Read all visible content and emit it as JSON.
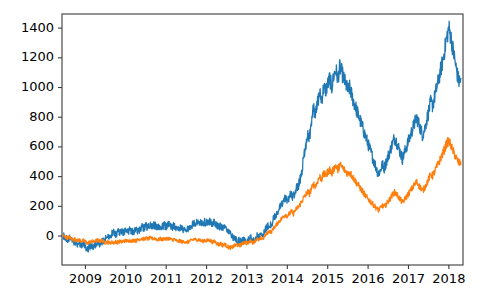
{
  "chart_data": {
    "type": "line",
    "title": "",
    "subtitle": "",
    "xlabel": "",
    "ylabel": "",
    "grid": false,
    "legend": "none",
    "xlim": [
      2008.42,
      2018.35
    ],
    "ylim": [
      -195,
      1495
    ],
    "x_tick_labels": [
      "2009",
      "2010",
      "2011",
      "2012",
      "2013",
      "2014",
      "2015",
      "2016",
      "2017",
      "2018"
    ],
    "x_tick_values": [
      2009,
      2010,
      2011,
      2012,
      2013,
      2014,
      2015,
      2016,
      2017,
      2018
    ],
    "y_tick_labels": [
      "0",
      "200",
      "400",
      "600",
      "800",
      "1000",
      "1200",
      "1400"
    ],
    "y_tick_values": [
      0,
      200,
      400,
      600,
      800,
      1000,
      1200,
      1400
    ],
    "colors": {
      "series_1": "#1f77b4",
      "series_2": "#ff7f0e",
      "axis": "#3b3b3b",
      "background": "#ffffff"
    },
    "series": [
      {
        "name": "series-1",
        "color": "#1f77b4",
        "x": [
          2008.45,
          2008.5,
          2008.55,
          2008.6,
          2008.65,
          2008.7,
          2008.75,
          2008.8,
          2008.85,
          2008.9,
          2008.95,
          2009.0,
          2009.05,
          2009.1,
          2009.15,
          2009.2,
          2009.25,
          2009.3,
          2009.35,
          2009.4,
          2009.45,
          2009.5,
          2009.55,
          2009.6,
          2009.65,
          2009.7,
          2009.75,
          2009.8,
          2009.85,
          2009.9,
          2009.95,
          2010.0,
          2010.05,
          2010.1,
          2010.15,
          2010.2,
          2010.25,
          2010.3,
          2010.35,
          2010.4,
          2010.45,
          2010.5,
          2010.55,
          2010.6,
          2010.65,
          2010.7,
          2010.75,
          2010.8,
          2010.85,
          2010.9,
          2010.95,
          2011.0,
          2011.05,
          2011.1,
          2011.15,
          2011.2,
          2011.25,
          2011.3,
          2011.35,
          2011.4,
          2011.45,
          2011.5,
          2011.55,
          2011.6,
          2011.65,
          2011.7,
          2011.75,
          2011.8,
          2011.85,
          2011.9,
          2011.95,
          2012.0,
          2012.05,
          2012.1,
          2012.15,
          2012.2,
          2012.25,
          2012.3,
          2012.35,
          2012.4,
          2012.45,
          2012.5,
          2012.55,
          2012.6,
          2012.65,
          2012.7,
          2012.75,
          2012.8,
          2012.85,
          2012.9,
          2012.95,
          2013.0,
          2013.05,
          2013.1,
          2013.15,
          2013.2,
          2013.25,
          2013.3,
          2013.35,
          2013.4,
          2013.45,
          2013.5,
          2013.55,
          2013.6,
          2013.65,
          2013.7,
          2013.75,
          2013.8,
          2013.85,
          2013.9,
          2013.95,
          2014.0,
          2014.05,
          2014.1,
          2014.15,
          2014.2,
          2014.25,
          2014.3,
          2014.35,
          2014.4,
          2014.45,
          2014.5,
          2014.55,
          2014.6,
          2014.65,
          2014.7,
          2014.75,
          2014.8,
          2014.85,
          2014.9,
          2014.95,
          2015.0,
          2015.05,
          2015.1,
          2015.15,
          2015.2,
          2015.25,
          2015.3,
          2015.35,
          2015.4,
          2015.45,
          2015.5,
          2015.55,
          2015.6,
          2015.65,
          2015.7,
          2015.75,
          2015.8,
          2015.85,
          2015.9,
          2015.95,
          2016.0,
          2016.05,
          2016.1,
          2016.15,
          2016.2,
          2016.25,
          2016.3,
          2016.35,
          2016.4,
          2016.45,
          2016.5,
          2016.55,
          2016.6,
          2016.65,
          2016.7,
          2016.75,
          2016.8,
          2016.85,
          2016.9,
          2016.95,
          2017.0,
          2017.05,
          2017.1,
          2017.15,
          2017.2,
          2017.25,
          2017.3,
          2017.35,
          2017.4,
          2017.45,
          2017.5,
          2017.55,
          2017.6,
          2017.65,
          2017.7,
          2017.75,
          2017.8,
          2017.85,
          2017.9,
          2017.95,
          2018.0,
          2018.05,
          2018.1,
          2018.15,
          2018.2,
          2018.25,
          2018.3
        ],
        "y": [
          5,
          -8,
          -20,
          -12,
          -28,
          -45,
          -38,
          -55,
          -48,
          -62,
          -58,
          -70,
          -85,
          -78,
          -65,
          -72,
          -60,
          -52,
          -58,
          -45,
          -30,
          -18,
          5,
          -10,
          15,
          25,
          10,
          30,
          20,
          35,
          25,
          40,
          30,
          45,
          35,
          28,
          42,
          30,
          48,
          60,
          52,
          68,
          58,
          72,
          60,
          75,
          65,
          58,
          70,
          60,
          72,
          65,
          78,
          70,
          60,
          72,
          55,
          48,
          60,
          40,
          52,
          35,
          48,
          58,
          75,
          95,
          88,
          100,
          92,
          85,
          95,
          88,
          100,
          92,
          80,
          95,
          75,
          60,
          72,
          50,
          62,
          45,
          30,
          15,
          -5,
          -20,
          -35,
          -28,
          -42,
          -30,
          -20,
          -35,
          -25,
          -10,
          -30,
          -15,
          5,
          -10,
          20,
          10,
          45,
          60,
          80,
          70,
          110,
          130,
          160,
          185,
          205,
          230,
          255,
          240,
          265,
          285,
          260,
          300,
          330,
          360,
          420,
          520,
          600,
          700,
          660,
          780,
          860,
          820,
          900,
          960,
          920,
          1000,
          980,
          1020,
          1060,
          1000,
          1080,
          1120,
          1060,
          1140,
          1100,
          1060,
          1020,
          980,
          1000,
          940,
          900,
          860,
          820,
          780,
          740,
          700,
          660,
          620,
          580,
          540,
          500,
          460,
          420,
          440,
          480,
          460,
          500,
          540,
          580,
          620,
          660,
          640,
          600,
          560,
          520,
          560,
          600,
          640,
          680,
          720,
          760,
          800,
          760,
          720,
          680,
          720,
          780,
          840,
          900,
          880,
          940,
          1000,
          1060,
          1120,
          1180,
          1260,
          1340,
          1400,
          1340,
          1260,
          1180,
          1100,
          1040,
          1060
        ],
        "y_min": -85,
        "y_max": 1400,
        "y_last": 1060
      },
      {
        "name": "series-2",
        "color": "#ff7f0e",
        "x": [
          2008.45,
          2008.5,
          2008.55,
          2008.6,
          2008.65,
          2008.7,
          2008.75,
          2008.8,
          2008.85,
          2008.9,
          2008.95,
          2009.0,
          2009.05,
          2009.1,
          2009.15,
          2009.2,
          2009.25,
          2009.3,
          2009.35,
          2009.4,
          2009.45,
          2009.5,
          2009.55,
          2009.6,
          2009.65,
          2009.7,
          2009.75,
          2009.8,
          2009.85,
          2009.9,
          2009.95,
          2010.0,
          2010.05,
          2010.1,
          2010.15,
          2010.2,
          2010.25,
          2010.3,
          2010.35,
          2010.4,
          2010.45,
          2010.5,
          2010.55,
          2010.6,
          2010.65,
          2010.7,
          2010.75,
          2010.8,
          2010.85,
          2010.9,
          2010.95,
          2011.0,
          2011.05,
          2011.1,
          2011.15,
          2011.2,
          2011.25,
          2011.3,
          2011.35,
          2011.4,
          2011.45,
          2011.5,
          2011.55,
          2011.6,
          2011.65,
          2011.7,
          2011.75,
          2011.8,
          2011.85,
          2011.9,
          2011.95,
          2012.0,
          2012.05,
          2012.1,
          2012.15,
          2012.2,
          2012.25,
          2012.3,
          2012.35,
          2012.4,
          2012.45,
          2012.5,
          2012.55,
          2012.6,
          2012.65,
          2012.7,
          2012.75,
          2012.8,
          2012.85,
          2012.9,
          2012.95,
          2013.0,
          2013.05,
          2013.1,
          2013.15,
          2013.2,
          2013.25,
          2013.3,
          2013.35,
          2013.4,
          2013.45,
          2013.5,
          2013.55,
          2013.6,
          2013.65,
          2013.7,
          2013.75,
          2013.8,
          2013.85,
          2013.9,
          2013.95,
          2014.0,
          2014.05,
          2014.1,
          2014.15,
          2014.2,
          2014.25,
          2014.3,
          2014.35,
          2014.4,
          2014.45,
          2014.5,
          2014.55,
          2014.6,
          2014.65,
          2014.7,
          2014.75,
          2014.8,
          2014.85,
          2014.9,
          2014.95,
          2015.0,
          2015.05,
          2015.1,
          2015.15,
          2015.2,
          2015.25,
          2015.3,
          2015.35,
          2015.4,
          2015.45,
          2015.5,
          2015.55,
          2015.6,
          2015.65,
          2015.7,
          2015.75,
          2015.8,
          2015.85,
          2015.9,
          2015.95,
          2016.0,
          2016.05,
          2016.1,
          2016.15,
          2016.2,
          2016.25,
          2016.3,
          2016.35,
          2016.4,
          2016.45,
          2016.5,
          2016.55,
          2016.6,
          2016.65,
          2016.7,
          2016.75,
          2016.8,
          2016.85,
          2016.9,
          2016.95,
          2017.0,
          2017.05,
          2017.1,
          2017.15,
          2017.2,
          2017.25,
          2017.3,
          2017.35,
          2017.4,
          2017.45,
          2017.5,
          2017.55,
          2017.6,
          2017.65,
          2017.7,
          2017.75,
          2017.8,
          2017.85,
          2017.9,
          2017.95,
          2018.0,
          2018.05,
          2018.1,
          2018.15,
          2018.2,
          2018.25,
          2018.3
        ],
        "y": [
          2,
          -5,
          -12,
          -8,
          -18,
          -25,
          -20,
          -30,
          -26,
          -35,
          -30,
          -38,
          -48,
          -42,
          -35,
          -40,
          -32,
          -28,
          -34,
          -28,
          -38,
          -45,
          -38,
          -48,
          -40,
          -45,
          -38,
          -42,
          -36,
          -40,
          -34,
          -30,
          -36,
          -28,
          -34,
          -26,
          -32,
          -24,
          -20,
          -16,
          -22,
          -14,
          -20,
          -12,
          -18,
          -14,
          -20,
          -26,
          -18,
          -24,
          -16,
          -22,
          -14,
          -20,
          -28,
          -20,
          -32,
          -38,
          -30,
          -42,
          -34,
          -45,
          -38,
          -32,
          -26,
          -20,
          -28,
          -22,
          -30,
          -36,
          -28,
          -34,
          -26,
          -32,
          -42,
          -34,
          -48,
          -58,
          -50,
          -62,
          -54,
          -68,
          -75,
          -80,
          -72,
          -65,
          -58,
          -66,
          -58,
          -48,
          -40,
          -50,
          -42,
          -30,
          -45,
          -32,
          -20,
          -30,
          -12,
          -20,
          5,
          18,
          35,
          25,
          50,
          65,
          85,
          100,
          115,
          130,
          145,
          135,
          150,
          165,
          150,
          175,
          190,
          205,
          230,
          255,
          275,
          300,
          285,
          320,
          350,
          335,
          370,
          400,
          385,
          420,
          410,
          430,
          450,
          420,
          455,
          475,
          445,
          480,
          465,
          450,
          435,
          420,
          430,
          405,
          385,
          365,
          345,
          325,
          305,
          285,
          265,
          250,
          235,
          220,
          205,
          190,
          175,
          185,
          205,
          195,
          215,
          235,
          255,
          275,
          295,
          285,
          265,
          245,
          225,
          245,
          265,
          285,
          305,
          325,
          345,
          365,
          345,
          325,
          305,
          325,
          355,
          385,
          415,
          405,
          435,
          465,
          495,
          525,
          555,
          590,
          625,
          640,
          610,
          575,
          545,
          515,
          490,
          500
        ],
        "y_min": -80,
        "y_max": 640,
        "y_last": 500
      }
    ]
  },
  "figure": {
    "axes": {
      "left_px": 62,
      "right_px": 463,
      "top_px": 14,
      "bottom_px": 265,
      "tick_length_px": 4,
      "spine_color": "#3b3b3b"
    }
  }
}
